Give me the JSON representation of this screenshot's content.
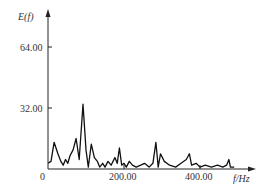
{
  "chart_data": {
    "type": "line",
    "title": "",
    "xlabel": "f/Hz",
    "ylabel": "E(f)",
    "xlim": [
      0,
      540
    ],
    "ylim": [
      0,
      80
    ],
    "grid": false,
    "legend": null,
    "x_ticks": [
      0,
      200.0,
      400.0
    ],
    "x_tick_labels": [
      "0",
      "200.00",
      "400.00"
    ],
    "y_ticks": [
      32.0,
      64.0
    ],
    "y_tick_labels": [
      "32.00",
      "64.00"
    ],
    "series": [
      {
        "name": "E(f)",
        "x": [
          0,
          8,
          16,
          26,
          34,
          40,
          46,
          52,
          58,
          66,
          74,
          82,
          92,
          100,
          106,
          114,
          122,
          130,
          136,
          144,
          150,
          158,
          166,
          176,
          182,
          188,
          194,
          200,
          206,
          214,
          222,
          232,
          244,
          254,
          266,
          276,
          284,
          290,
          296,
          306,
          320,
          336,
          350,
          364,
          372,
          378,
          390,
          400,
          414,
          430,
          446,
          460,
          470,
          476,
          480,
          490
        ],
        "values": [
          3,
          4,
          14,
          8,
          4,
          2,
          5,
          3,
          7,
          10,
          16,
          5,
          34,
          10,
          1,
          13,
          6,
          4,
          1,
          3,
          1,
          4,
          2,
          6,
          3,
          11,
          2,
          3,
          1,
          4,
          2,
          1,
          2,
          3,
          1,
          3,
          14,
          1,
          8,
          4,
          2,
          1,
          3,
          5,
          8,
          2,
          3,
          1,
          2,
          1,
          2,
          1,
          2,
          5,
          1,
          1
        ]
      }
    ]
  },
  "labels": {
    "y_axis_title": "E(f)",
    "x_axis_title": "f/Hz",
    "origin": "0",
    "x200": "200.00",
    "x400": "400.00",
    "y32": "32.00",
    "y64": "64.00"
  }
}
